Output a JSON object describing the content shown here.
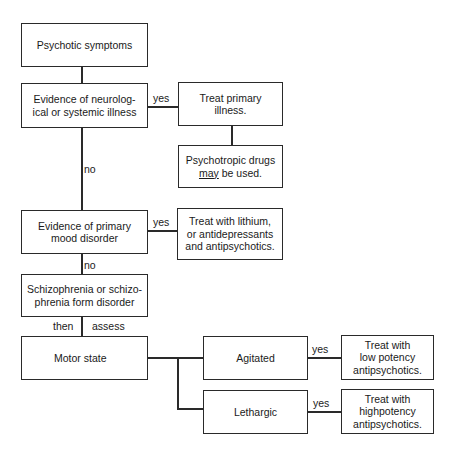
{
  "flowchart": {
    "nodes": {
      "psychotic_symptoms": "Psychotic symptoms",
      "neuro_illness": "Evidence of neurolog-\nical or systemic illness",
      "treat_primary": "Treat primary\nillness.",
      "psychotropic_prefix": "Psychotropic drugs",
      "psychotropic_may": "may",
      "psychotropic_suffix": " be used.",
      "mood_disorder": "Evidence of primary\nmood disorder",
      "treat_lithium": "Treat with lithium,\nor antidepressants\nand antipsychotics.",
      "schizophrenia": "Schizophrenia or schizo-\nphrenia form disorder",
      "motor_state": "Motor state",
      "agitated": "Agitated",
      "lethargic": "Lethargic",
      "treat_low": "Treat with\nlow potency\nantipsychotics.",
      "treat_high": "Treat with\nhighpotency\nantipsychotics."
    },
    "edge_labels": {
      "neuro_yes": "yes",
      "neuro_no": "no",
      "mood_yes": "yes",
      "mood_no": "no",
      "then": "then",
      "assess": "assess",
      "agitated_yes": "yes",
      "lethargic_yes": "yes"
    }
  }
}
